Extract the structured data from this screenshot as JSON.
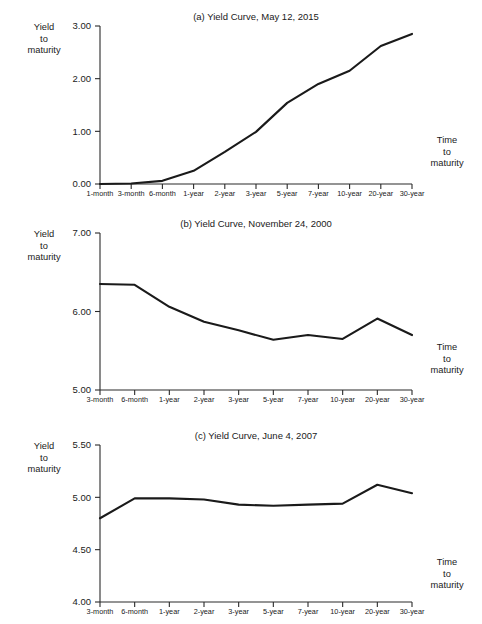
{
  "figure": {
    "y_axis_caption_lines": [
      "Yield",
      "to",
      "maturity"
    ],
    "x_axis_caption_lines": [
      "Time",
      "to",
      "maturity"
    ],
    "line_color": "#1a1a1a",
    "axis_color": "#2a2a2a",
    "background_color": "#ffffff"
  },
  "chart_data": [
    {
      "id": "a",
      "type": "line",
      "title": "(a) Yield Curve, May 12, 2015",
      "xlabel": "Time to maturity",
      "ylabel": "Yield to maturity",
      "categories": [
        "1-month",
        "3-month",
        "6-month",
        "1-year",
        "2-year",
        "3-year",
        "5-year",
        "7-year",
        "10-year",
        "20-year",
        "30-year"
      ],
      "values": [
        0.0,
        0.01,
        0.06,
        0.25,
        0.61,
        0.99,
        1.54,
        1.9,
        2.15,
        2.62,
        2.85
      ],
      "ylim": [
        0.0,
        3.0
      ],
      "yticks": [
        0.0,
        1.0,
        2.0,
        3.0
      ],
      "ytick_labels": [
        "0.00",
        "1.00",
        "2.00",
        "3.00"
      ],
      "grid": false,
      "legend": "none"
    },
    {
      "id": "b",
      "type": "line",
      "title": "(b) Yield Curve, November 24, 2000",
      "xlabel": "Time to maturity",
      "ylabel": "Yield to maturity",
      "categories": [
        "3-month",
        "6-month",
        "1-year",
        "2-year",
        "3-year",
        "5-year",
        "7-year",
        "10-year",
        "20-year",
        "30-year"
      ],
      "values": [
        6.35,
        6.34,
        6.06,
        5.87,
        5.76,
        5.64,
        5.7,
        5.65,
        5.91,
        5.7
      ],
      "ylim": [
        5.0,
        7.0
      ],
      "yticks": [
        5.0,
        6.0,
        7.0
      ],
      "ytick_labels": [
        "5.00",
        "6.00",
        "7.00"
      ],
      "grid": false,
      "legend": "none"
    },
    {
      "id": "c",
      "type": "line",
      "title": "(c) Yield Curve, June 4, 2007",
      "xlabel": "Time to maturity",
      "ylabel": "Yield to maturity",
      "categories": [
        "3-month",
        "6-month",
        "1-year",
        "2-year",
        "3-year",
        "5-year",
        "7-year",
        "10-year",
        "20-year",
        "30-year"
      ],
      "values": [
        4.8,
        4.99,
        4.99,
        4.98,
        4.93,
        4.92,
        4.93,
        4.94,
        5.12,
        5.04
      ],
      "ylim": [
        4.0,
        5.5
      ],
      "yticks": [
        4.0,
        4.5,
        5.0,
        5.5
      ],
      "ytick_labels": [
        "4.00",
        "4.50",
        "5.00",
        "5.50"
      ],
      "grid": false,
      "legend": "none"
    }
  ]
}
